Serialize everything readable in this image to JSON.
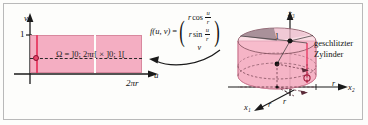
{
  "figure": {
    "accent_pink": "#f4aec2",
    "accent_red": "#e8456b",
    "line_color": "#1a1a1a"
  },
  "left_panel": {
    "name": "parameter-domain",
    "axis_v_label": "v",
    "axis_u_label": "u",
    "tick_v_one": "1",
    "tick_u_2pir": "2πr",
    "domain_equation": "Ω = ]0; 2πr[ × ]0; 1[",
    "domain_equation_parts": {
      "symbol": "Ω",
      "equals": "=",
      "u_interval": "]0; 2πr[",
      "times": "×",
      "v_interval": "]0; 1["
    }
  },
  "middle_panel": {
    "name": "mapping-formula",
    "function_name": "f(u, v)",
    "equals": "=",
    "components": [
      {
        "coef": "r",
        "fn": "cos",
        "frac_num": "u",
        "frac_den": "r"
      },
      {
        "coef": "r",
        "fn": "sin",
        "frac_num": "u",
        "frac_den": "r"
      },
      {
        "coef": "v",
        "fn": "",
        "frac_num": "",
        "frac_den": ""
      }
    ],
    "arrow": "curved-left-arrow"
  },
  "right_panel": {
    "name": "cylinder-3d",
    "axis_x3_label": "x₃",
    "axis_x2_label": "x₂",
    "axis_x1_label": "x₁",
    "height_label": "1",
    "radius_label_right": "r",
    "radius_label_a": "r",
    "radius_label_b": "r",
    "caption": "geschlitzter Zylinder"
  }
}
